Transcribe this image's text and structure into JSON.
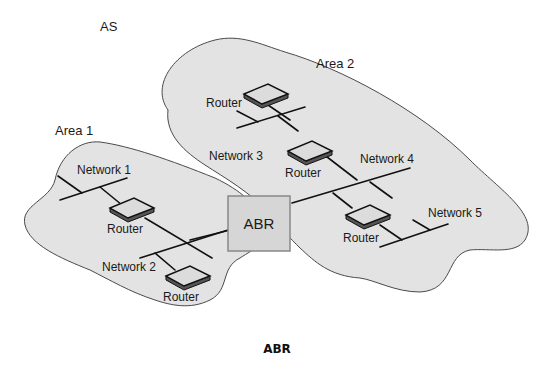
{
  "diagram": {
    "as_label": "AS",
    "caption": "ABR",
    "abr_label": "ABR",
    "areas": [
      {
        "id": "area1",
        "label": "Area 1",
        "networks": [
          "Network 1",
          "Network 2"
        ],
        "routers": [
          "Router",
          "Router"
        ]
      },
      {
        "id": "area2",
        "label": "Area 2",
        "networks": [
          "Network 3",
          "Network 4",
          "Network 5"
        ],
        "routers": [
          "Router",
          "Router",
          "Router"
        ]
      }
    ],
    "colors": {
      "area_fill": "#e3e3e3",
      "area_stroke": "#4a4a4a",
      "abr_fill": "#d6d6d6",
      "abr_stroke": "#888888",
      "wire": "#111111"
    }
  }
}
